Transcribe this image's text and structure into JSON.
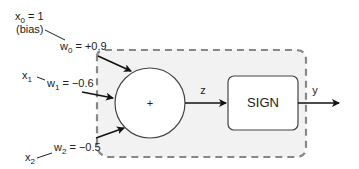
{
  "diagram": {
    "inputs": [
      {
        "var": "x",
        "sub": "0",
        "rest": " = 1",
        "note": "(bias)",
        "weight_var": "w",
        "weight_sub": "0",
        "weight_value": " = +0.9"
      },
      {
        "var": "x",
        "sub": "1",
        "rest": "",
        "note": "",
        "weight_var": "w",
        "weight_sub": "1",
        "weight_value": " = −0.6"
      },
      {
        "var": "x",
        "sub": "2",
        "rest": "",
        "note": "",
        "weight_var": "w",
        "weight_sub": "2",
        "weight_value": " = −0.5"
      }
    ],
    "sum_node": {
      "symbol": "+"
    },
    "activation": {
      "label": "SIGN"
    },
    "intermediate_label": "z",
    "output_label": "y",
    "colors": {
      "stroke": "#333333",
      "dashed_border": "#888888",
      "fill_region": "#f2f2f2",
      "node_fill": "#ffffff"
    }
  }
}
